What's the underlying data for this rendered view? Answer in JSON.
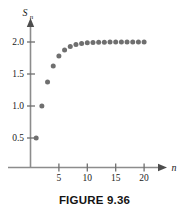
{
  "figure": {
    "caption": "FIGURE 9.36",
    "colors": {
      "dot": "#6f6f6f",
      "axis": "#8c8c8c",
      "text": "#1a1a1a",
      "background": "#ffffff"
    }
  },
  "chart_data": {
    "type": "scatter",
    "title": "",
    "xlabel": "n",
    "ylabel": "S_n",
    "ylabel_display": "S",
    "ylabel_subscript": "n",
    "xlim": [
      0,
      22
    ],
    "ylim": [
      0,
      2.25
    ],
    "grid": false,
    "legend": null,
    "xticks": [
      5,
      10,
      15,
      20
    ],
    "xtick_labels": [
      "5",
      "10",
      "15",
      "20"
    ],
    "yticks": [
      0.5,
      1.0,
      1.5,
      2.0
    ],
    "ytick_labels": [
      "0.5",
      "1.0",
      "1.5",
      "2.0"
    ],
    "x": [
      1,
      2,
      3,
      4,
      5,
      6,
      7,
      8,
      9,
      10,
      11,
      12,
      13,
      14,
      15,
      16,
      17,
      18,
      19,
      20
    ],
    "values": [
      0.5,
      1.0,
      1.375,
      1.625,
      1.781,
      1.875,
      1.93,
      1.961,
      1.978,
      1.988,
      1.993,
      1.996,
      1.998,
      1.999,
      1.999,
      2.0,
      2.0,
      2.0,
      2.0,
      2.0
    ],
    "series": [
      {
        "name": "S_n",
        "values": [
          0.5,
          1.0,
          1.375,
          1.625,
          1.781,
          1.875,
          1.93,
          1.961,
          1.978,
          1.988,
          1.993,
          1.996,
          1.998,
          1.999,
          1.999,
          2.0,
          2.0,
          2.0,
          2.0,
          2.0
        ]
      }
    ],
    "annotations": []
  }
}
